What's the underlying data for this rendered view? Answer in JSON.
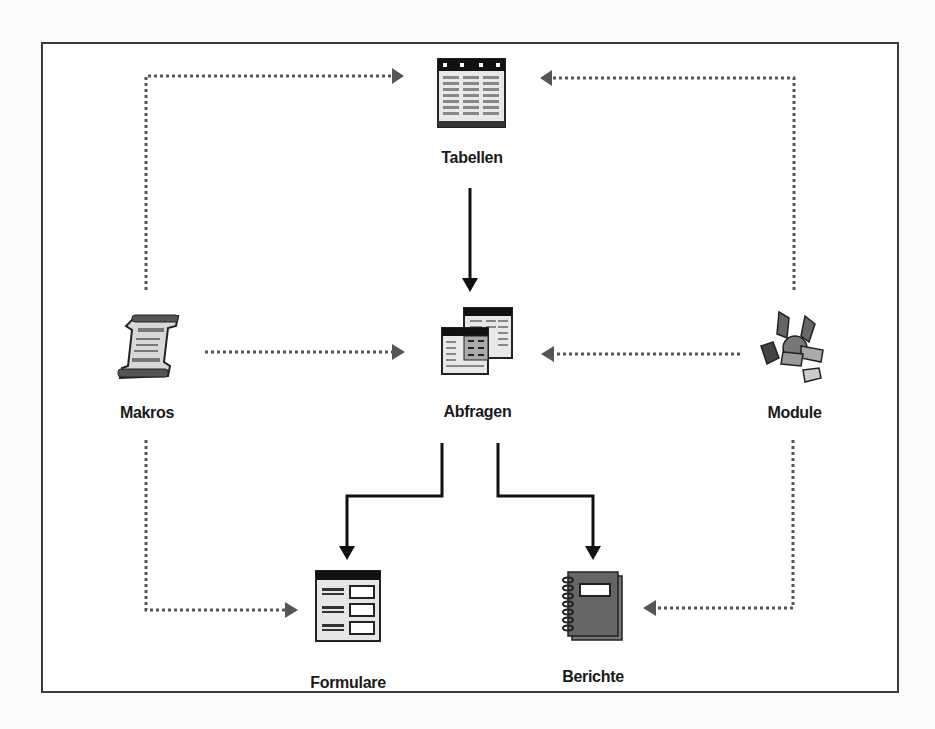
{
  "diagram": {
    "type": "access-database-object-relationships",
    "colors": {
      "frame": "#3a3a3a",
      "solid_arrow": "#111111",
      "dotted_arrow": "#555555",
      "label": "#1a1a1a",
      "background": "#ffffff"
    },
    "nodes": {
      "tabellen": {
        "label": "Tabellen",
        "icon": "table-icon"
      },
      "abfragen": {
        "label": "Abfragen",
        "icon": "query-icon"
      },
      "makros": {
        "label": "Makros",
        "icon": "macro-scroll-icon"
      },
      "module": {
        "label": "Module",
        "icon": "module-icon"
      },
      "formulare": {
        "label": "Formulare",
        "icon": "form-icon"
      },
      "berichte": {
        "label": "Berichte",
        "icon": "report-icon"
      }
    },
    "edges": [
      {
        "from": "Tabellen",
        "to": "Abfragen",
        "style": "solid"
      },
      {
        "from": "Abfragen",
        "to": "Formulare",
        "style": "solid"
      },
      {
        "from": "Abfragen",
        "to": "Berichte",
        "style": "solid"
      },
      {
        "from": "Makros",
        "to": "Tabellen",
        "style": "dotted"
      },
      {
        "from": "Makros",
        "to": "Abfragen",
        "style": "dotted"
      },
      {
        "from": "Makros",
        "to": "Formulare",
        "style": "dotted"
      },
      {
        "from": "Module",
        "to": "Tabellen",
        "style": "dotted"
      },
      {
        "from": "Module",
        "to": "Abfragen",
        "style": "dotted"
      },
      {
        "from": "Module",
        "to": "Berichte",
        "style": "dotted"
      }
    ]
  }
}
